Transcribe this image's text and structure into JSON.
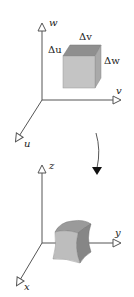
{
  "figure": {
    "top_panel": {
      "axes": {
        "vertical": "w",
        "horizontal": "v",
        "diagonal": "u"
      },
      "box_labels": {
        "top_edge": "Δv",
        "left_edge": "Δu",
        "right_edge": "Δw"
      }
    },
    "transform_arrow": "curved-down-arrow",
    "bottom_panel": {
      "axes": {
        "vertical": "z",
        "horizontal": "y",
        "diagonal": "x"
      }
    },
    "colors": {
      "axis": "#555555",
      "box_front": "#c4c4c4",
      "box_top": "#8f8f8f",
      "box_side": "#a9a9a9",
      "curved_front": "#bdbdbd",
      "curved_top": "#9a9a9a",
      "curved_side": "#868686"
    }
  }
}
